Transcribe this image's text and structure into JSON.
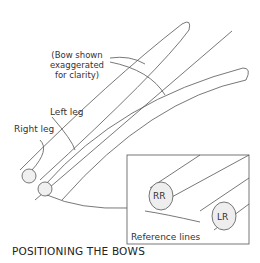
{
  "diagram": {
    "title": "POSITIONING THE BOWS",
    "labels": {
      "note_line1": "(Bow shown",
      "note_line2": "exaggerated",
      "note_line3": "for clarity)",
      "left_leg": "Left leg",
      "right_leg": "Right leg",
      "reference_lines": "Reference lines"
    },
    "inset": {
      "rod_right": "RR",
      "rod_left": "LR"
    },
    "line_color": "#555555"
  }
}
